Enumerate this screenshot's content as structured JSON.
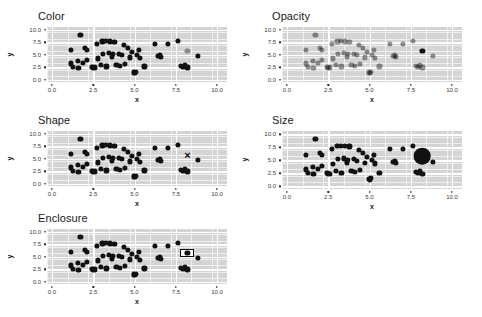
{
  "figure": {
    "background_color": "#ffffff",
    "panel_background_color": "#d4d4d4",
    "gridline_color": "#ffffff",
    "point_color": "#111111",
    "highlight_color_gray": "#8a8a8a"
  },
  "chart_data": [
    {
      "type": "scatter",
      "title": "Color",
      "xlabel": "x",
      "ylabel": "y",
      "xlim": [
        -0.3,
        10.6
      ],
      "ylim": [
        -0.5,
        10.6
      ],
      "xticks": [
        "0.0",
        "2.5",
        "5.0",
        "7.5",
        "10.0"
      ],
      "xtick_values": [
        0.0,
        2.5,
        5.0,
        7.5,
        10.0
      ],
      "yticks": [
        "0.0",
        "2.5",
        "5.0",
        "7.5",
        "10.0"
      ],
      "ytick_values": [
        0.0,
        2.5,
        5.0,
        7.5,
        10.0
      ],
      "grid": true,
      "legend": "none",
      "highlight_channel": "color",
      "highlight_point": {
        "x": 8.2,
        "y": 5.8,
        "color": "#8a8a8a"
      },
      "annotation": "One point rendered in light gray while all others are black.",
      "points": [
        {
          "x": 1.15,
          "y": 5.95
        },
        {
          "x": 1.15,
          "y": 3.25
        },
        {
          "x": 1.25,
          "y": 2.55
        },
        {
          "x": 1.55,
          "y": 3.75
        },
        {
          "x": 1.6,
          "y": 2.4
        },
        {
          "x": 1.72,
          "y": 9.05
        },
        {
          "x": 1.85,
          "y": 3.4
        },
        {
          "x": 2.0,
          "y": 6.35
        },
        {
          "x": 2.1,
          "y": 6.0
        },
        {
          "x": 2.1,
          "y": 3.95
        },
        {
          "x": 2.45,
          "y": 2.6
        },
        {
          "x": 2.5,
          "y": 2.35
        },
        {
          "x": 2.62,
          "y": 2.45
        },
        {
          "x": 2.72,
          "y": 7.15
        },
        {
          "x": 2.78,
          "y": 4.25
        },
        {
          "x": 2.95,
          "y": 3.0
        },
        {
          "x": 3.05,
          "y": 7.7
        },
        {
          "x": 3.1,
          "y": 5.2
        },
        {
          "x": 3.25,
          "y": 7.75
        },
        {
          "x": 3.3,
          "y": 2.65
        },
        {
          "x": 3.45,
          "y": 5.35
        },
        {
          "x": 3.5,
          "y": 7.7
        },
        {
          "x": 3.62,
          "y": 4.6
        },
        {
          "x": 3.7,
          "y": 5.1
        },
        {
          "x": 3.78,
          "y": 7.65
        },
        {
          "x": 3.9,
          "y": 2.95
        },
        {
          "x": 4.05,
          "y": 5.25
        },
        {
          "x": 4.12,
          "y": 2.7
        },
        {
          "x": 4.25,
          "y": 4.9
        },
        {
          "x": 4.35,
          "y": 7.0
        },
        {
          "x": 4.4,
          "y": 3.2
        },
        {
          "x": 4.6,
          "y": 6.35
        },
        {
          "x": 4.72,
          "y": 4.45
        },
        {
          "x": 4.85,
          "y": 5.6
        },
        {
          "x": 4.95,
          "y": 1.45
        },
        {
          "x": 5.02,
          "y": 1.3
        },
        {
          "x": 5.1,
          "y": 1.55
        },
        {
          "x": 5.15,
          "y": 5.05
        },
        {
          "x": 5.25,
          "y": 6.05
        },
        {
          "x": 5.35,
          "y": 4.4
        },
        {
          "x": 5.6,
          "y": 2.65
        },
        {
          "x": 6.25,
          "y": 7.25
        },
        {
          "x": 6.45,
          "y": 4.75
        },
        {
          "x": 6.55,
          "y": 4.85
        },
        {
          "x": 6.62,
          "y": 4.55
        },
        {
          "x": 7.0,
          "y": 7.15
        },
        {
          "x": 7.62,
          "y": 7.75
        },
        {
          "x": 7.8,
          "y": 2.8
        },
        {
          "x": 7.95,
          "y": 2.55
        },
        {
          "x": 8.05,
          "y": 2.85
        },
        {
          "x": 8.2,
          "y": 2.45
        },
        {
          "x": 8.85,
          "y": 4.75
        }
      ]
    },
    {
      "type": "scatter",
      "title": "Opacity",
      "xlabel": "x",
      "ylabel": "y",
      "xlim": [
        -0.3,
        10.6
      ],
      "ylim": [
        -0.5,
        10.6
      ],
      "xticks": [
        "0.0",
        "2.5",
        "5.0",
        "7.5",
        "10.0"
      ],
      "xtick_values": [
        0.0,
        2.5,
        5.0,
        7.5,
        10.0
      ],
      "yticks": [
        "0.0",
        "2.5",
        "5.0",
        "7.5",
        "10.0"
      ],
      "ytick_values": [
        0.0,
        2.5,
        5.0,
        7.5,
        10.0
      ],
      "grid": true,
      "legend": "none",
      "highlight_channel": "opacity",
      "highlight_point": {
        "x": 8.2,
        "y": 5.8,
        "opacity": 1.0
      },
      "background_opacity": 0.45,
      "annotation": "All points semi-transparent except one fully opaque point."
    },
    {
      "type": "scatter",
      "title": "Shape",
      "xlabel": "x",
      "ylabel": "y",
      "xlim": [
        -0.3,
        10.6
      ],
      "ylim": [
        -0.5,
        10.6
      ],
      "xticks": [
        "0.0",
        "2.5",
        "5.0",
        "7.5",
        "10.0"
      ],
      "xtick_values": [
        0.0,
        2.5,
        5.0,
        7.5,
        10.0
      ],
      "yticks": [
        "0.0",
        "2.5",
        "5.0",
        "7.5",
        "10.0"
      ],
      "ytick_values": [
        0.0,
        2.5,
        5.0,
        7.5,
        10.0
      ],
      "grid": true,
      "legend": "none",
      "highlight_channel": "shape",
      "highlight_point": {
        "x": 8.2,
        "y": 5.8,
        "marker": "x"
      },
      "annotation": "One point drawn as a cross marker among filled circles."
    },
    {
      "type": "scatter",
      "title": "Size",
      "xlabel": "x",
      "ylabel": "y",
      "xlim": [
        -0.3,
        10.6
      ],
      "ylim": [
        -0.5,
        10.6
      ],
      "xticks": [
        "0.0",
        "2.5",
        "5.0",
        "7.5",
        "10.0"
      ],
      "xtick_values": [
        0.0,
        2.5,
        5.0,
        7.5,
        10.0
      ],
      "yticks": [
        "0.0",
        "2.5",
        "5.0",
        "7.5",
        "10.0"
      ],
      "ytick_values": [
        0.0,
        2.5,
        5.0,
        7.5,
        10.0
      ],
      "grid": true,
      "legend": "none",
      "highlight_channel": "size",
      "highlight_point": {
        "x": 8.2,
        "y": 5.8,
        "radius_multiplier": 3.2
      },
      "annotation": "One point drawn much larger than the rest."
    },
    {
      "type": "scatter",
      "title": "Enclosure",
      "xlabel": "x",
      "ylabel": "y",
      "xlim": [
        -0.3,
        10.6
      ],
      "ylim": [
        -0.5,
        10.6
      ],
      "xticks": [
        "0.0",
        "2.5",
        "5.0",
        "7.5",
        "10.0"
      ],
      "xtick_values": [
        0.0,
        2.5,
        5.0,
        7.5,
        10.0
      ],
      "yticks": [
        "0.0",
        "2.5",
        "5.0",
        "7.5",
        "10.0"
      ],
      "ytick_values": [
        0.0,
        2.5,
        5.0,
        7.5,
        10.0
      ],
      "grid": true,
      "legend": "none",
      "highlight_channel": "enclosure",
      "highlight_point": {
        "x": 8.2,
        "y": 5.8
      },
      "annotation": "One point surrounded by a black rectangular outline."
    }
  ]
}
